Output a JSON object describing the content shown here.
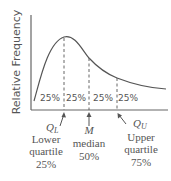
{
  "diagram": {
    "y_axis_label": "Relative Frequency",
    "segment_labels": [
      "25%",
      "25%",
      "25%",
      "25%"
    ],
    "markers": [
      {
        "symbol": "Q",
        "subscript": "L",
        "name_line1": "Lower",
        "name_line2": "quartile",
        "percent": "25%"
      },
      {
        "symbol": "M",
        "subscript": "",
        "name_line1": "",
        "name_line2": "median",
        "percent": "50%"
      },
      {
        "symbol": "Q",
        "subscript": "U",
        "name_line1": "Upper",
        "name_line2": "quartile",
        "percent": "75%"
      }
    ],
    "colors": {
      "line": "#555555",
      "axis": "#666666",
      "text": "#555555"
    }
  }
}
